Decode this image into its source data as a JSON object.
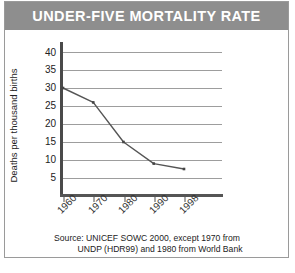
{
  "title": "UNDER-FIVE MORTALITY RATE",
  "colors": {
    "banner": "#8e8e8e",
    "title_text": "#ffffff",
    "gridline": "#9d9d9d",
    "axis": "#4a4a4a",
    "line": "#555555",
    "background": "#ffffff",
    "border": "#9a9a9a"
  },
  "source": {
    "line1": "Source: UNICEF SOWC 2000, except 1970 from",
    "line2": "UNDP (HDR99) and 1980 from World Bank"
  },
  "chart_data": {
    "type": "line",
    "title": "UNDER-FIVE MORTALITY RATE",
    "xlabel": "",
    "ylabel": "Deaths per thousand births",
    "categories": [
      "1960",
      "1970",
      "1980",
      "1990",
      "1998"
    ],
    "x": [
      1960,
      1970,
      1980,
      1990,
      1998
    ],
    "values": [
      30,
      26,
      15,
      9,
      7.5
    ],
    "series": [
      {
        "name": "Under-five mortality rate",
        "values": [
          30,
          26,
          15,
          9,
          7.5
        ]
      }
    ],
    "ylim": [
      0,
      42
    ],
    "yticks": [
      5,
      10,
      15,
      20,
      25,
      30,
      35,
      40
    ],
    "ytick_labels": [
      "5",
      "10",
      "15",
      "20",
      "25",
      "30",
      "35",
      "40"
    ],
    "xtick_labels": [
      "1960",
      "1970",
      "1980",
      "1990",
      "1998"
    ],
    "grid": true,
    "grid_axis": "y",
    "legend": false,
    "legend_position": "none",
    "markers": true,
    "annotations": [
      "Source: UNICEF SOWC 2000, except 1970 from",
      "UNDP (HDR99) and 1980 from World Bank"
    ]
  }
}
